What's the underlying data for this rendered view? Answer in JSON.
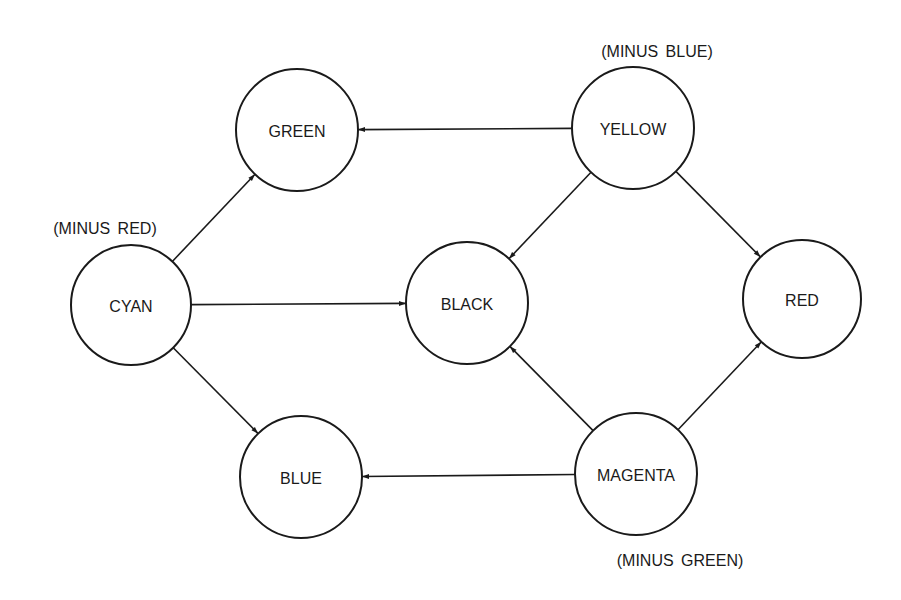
{
  "diagram": {
    "nodes": [
      {
        "id": "green",
        "label": "GREEN",
        "cx": 297,
        "cy": 130,
        "r": 61
      },
      {
        "id": "yellow",
        "label": "YELLOW",
        "cx": 633,
        "cy": 128,
        "r": 61
      },
      {
        "id": "cyan",
        "label": "CYAN",
        "cx": 131,
        "cy": 305,
        "r": 60
      },
      {
        "id": "black",
        "label": "BLACK",
        "cx": 467,
        "cy": 303,
        "r": 61
      },
      {
        "id": "red",
        "label": "RED",
        "cx": 802,
        "cy": 299,
        "r": 59
      },
      {
        "id": "blue",
        "label": "BLUE",
        "cx": 301,
        "cy": 477,
        "r": 61
      },
      {
        "id": "magenta",
        "label": "MAGENTA",
        "cx": 636,
        "cy": 474,
        "r": 61
      }
    ],
    "annotations": [
      {
        "id": "minus-red",
        "text": "(MINUS RED)",
        "x": 105,
        "y": 228,
        "node": "cyan"
      },
      {
        "id": "minus-blue",
        "text": "(MINUS BLUE)",
        "x": 657,
        "y": 51,
        "node": "yellow"
      },
      {
        "id": "minus-green",
        "text": "(MINUS GREEN)",
        "x": 680,
        "y": 560,
        "node": "magenta"
      }
    ],
    "edges": [
      {
        "from": "yellow",
        "to": "green"
      },
      {
        "from": "yellow",
        "to": "black"
      },
      {
        "from": "yellow",
        "to": "red"
      },
      {
        "from": "cyan",
        "to": "green"
      },
      {
        "from": "cyan",
        "to": "black"
      },
      {
        "from": "cyan",
        "to": "blue"
      },
      {
        "from": "magenta",
        "to": "black"
      },
      {
        "from": "magenta",
        "to": "red"
      },
      {
        "from": "magenta",
        "to": "blue"
      }
    ],
    "colors": {
      "stroke": "#1a1a1a",
      "background": "#ffffff"
    }
  }
}
